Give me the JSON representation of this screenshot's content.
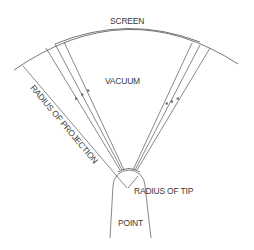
{
  "diagram": {
    "type": "field-ion-microscope-schematic",
    "labels": {
      "screen": "SCREEN",
      "vacuum": "VACUUM",
      "radius_of_projection": "RADIUS OF PROJECTION",
      "radius_of_tip": "RADIUS OF TIP",
      "point": "POINT"
    },
    "elements": {
      "screen_arc": "curved fluorescent screen at top",
      "ray_groups": [
        {
          "side": "left",
          "count": 3,
          "arrows": "pointing toward screen"
        },
        {
          "side": "right",
          "count": 3,
          "arrows": "pointing toward screen"
        }
      ],
      "tip": "hemispherical point apex",
      "radius_of_projection_line": "line from screen to tip center",
      "radius_of_tip_line": "short radius inside tip apex"
    },
    "colors": {
      "line": "#555555",
      "text": "#3a3a3a",
      "background": "#ffffff"
    }
  }
}
